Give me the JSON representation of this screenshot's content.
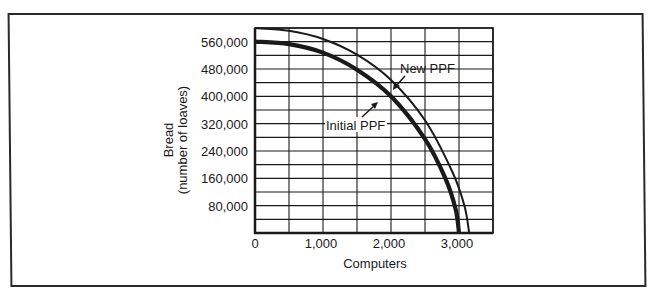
{
  "chart_data": {
    "type": "line",
    "title": "",
    "xlabel": "Computers",
    "ylabel": "Bread (number of loaves)",
    "ylabel_lines": [
      "Bread",
      "(number of loaves)"
    ],
    "xlim": [
      0,
      3500
    ],
    "ylim": [
      0,
      600000
    ],
    "grid": true,
    "x_grid_step": 500,
    "y_grid_step": 40000,
    "x_ticks": [
      {
        "value": 0,
        "label": "0"
      },
      {
        "value": 1000,
        "label": "1,000"
      },
      {
        "value": 2000,
        "label": "2,000"
      },
      {
        "value": 3000,
        "label": "3,000"
      }
    ],
    "y_ticks": [
      {
        "value": 80000,
        "label": "80,000"
      },
      {
        "value": 160000,
        "label": "160,000"
      },
      {
        "value": 240000,
        "label": "240,000"
      },
      {
        "value": 320000,
        "label": "320,000"
      },
      {
        "value": 400000,
        "label": "400,000"
      },
      {
        "value": 480000,
        "label": "480,000"
      },
      {
        "value": 560000,
        "label": "560,000"
      }
    ],
    "series": [
      {
        "name": "Initial PPF",
        "style": "thick",
        "x": [
          0,
          500,
          1000,
          1500,
          2000,
          2500,
          2800,
          2950,
          3000
        ],
        "y": [
          560000,
          553000,
          528000,
          478000,
          400000,
          275000,
          160000,
          70000,
          0
        ]
      },
      {
        "name": "New PPF",
        "style": "thin",
        "x": [
          0,
          500,
          1000,
          1500,
          2000,
          2500,
          2900,
          3080,
          3150
        ],
        "y": [
          600000,
          592000,
          568000,
          522000,
          448000,
          330000,
          180000,
          80000,
          0
        ]
      }
    ],
    "annotations": [
      {
        "text": "New PPF",
        "points_to": "New PPF",
        "label_x": 2150,
        "label_y": 480000
      },
      {
        "text": "Initial PPF",
        "points_to": "Initial PPF",
        "label_x": 1050,
        "label_y": 310000
      }
    ],
    "legend": "none (inline annotations)"
  },
  "labels": {
    "top_caption": "",
    "x_axis_title": "Computers",
    "y_axis_title_line1": "Bread",
    "y_axis_title_line2": "(number of loaves)",
    "new_ppf": "New PPF",
    "initial_ppf": "Initial PPF"
  },
  "colors": {
    "ink": "#1a1a1a",
    "frame": "#2a2a2a",
    "background": "#ffffff"
  }
}
